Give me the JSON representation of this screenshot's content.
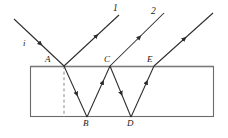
{
  "figure": {
    "background_color": "#ffffff",
    "line_color": "#2b2b2b",
    "slab_border_color": "#6b6b6b",
    "dashed_line_color": "#8a8a8a",
    "slab": {
      "x": 30,
      "y": 66,
      "width": 184,
      "height": 51
    },
    "points": [
      {
        "name": "A",
        "x": 64,
        "y": 66,
        "label": "A",
        "label_x": 45,
        "label_y": 55
      },
      {
        "name": "B",
        "x": 87,
        "y": 117,
        "label": "B",
        "label_x": 83,
        "label_y": 119
      },
      {
        "name": "C",
        "x": 110,
        "y": 66,
        "label": "C",
        "label_x": 104,
        "label_y": 55
      },
      {
        "name": "D",
        "x": 131,
        "y": 117,
        "label": "D",
        "label_x": 127,
        "label_y": 119
      },
      {
        "name": "E",
        "x": 154,
        "y": 66,
        "label": "E",
        "label_x": 147,
        "label_y": 55
      }
    ],
    "rays": [
      {
        "name": "incident-ray",
        "from": [
          14,
          19
        ],
        "to": [
          64,
          66
        ],
        "arrow_at": 0.52
      },
      {
        "name": "reflected-ray-1",
        "from": [
          64,
          66
        ],
        "to": [
          119,
          15
        ],
        "arrow_at": 0.55
      },
      {
        "name": "internal-ray-A-B",
        "from": [
          64,
          66
        ],
        "to": [
          87,
          117
        ],
        "arrow_at": 0.55
      },
      {
        "name": "internal-ray-B-C",
        "from": [
          87,
          117
        ],
        "to": [
          110,
          66
        ],
        "arrow_at": 0.55
      },
      {
        "name": "emergent-ray-2",
        "from": [
          110,
          66
        ],
        "to": [
          164,
          13
        ],
        "arrow_at": 0.55
      },
      {
        "name": "internal-ray-C-D",
        "from": [
          110,
          66
        ],
        "to": [
          131,
          117
        ],
        "arrow_at": 0.55
      },
      {
        "name": "internal-ray-D-E",
        "from": [
          131,
          117
        ],
        "to": [
          154,
          66
        ],
        "arrow_at": 0.55
      },
      {
        "name": "emergent-ray-3",
        "from": [
          154,
          66
        ],
        "to": [
          213,
          13
        ],
        "arrow_at": 0.55
      }
    ],
    "dashed_normal": {
      "x": 64,
      "y1": 66,
      "y2": 117
    },
    "labels": {
      "incident": {
        "text": "i",
        "x": 23,
        "y": 39
      },
      "ray1": {
        "text": "1",
        "x": 113,
        "y": 4
      },
      "ray2": {
        "text": "2",
        "x": 151,
        "y": 7
      },
      "pointA": {
        "text": "A",
        "x": 45,
        "y": 55
      },
      "pointB": {
        "text": "B",
        "x": 83,
        "y": 119
      },
      "pointC": {
        "text": "C",
        "x": 104,
        "y": 55
      },
      "pointD": {
        "text": "D",
        "x": 127,
        "y": 119
      },
      "pointE": {
        "text": "E",
        "x": 147,
        "y": 55
      }
    }
  }
}
